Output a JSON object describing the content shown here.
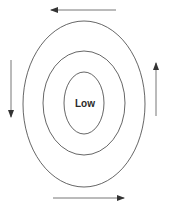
{
  "diagram": {
    "center_label": "Low",
    "line_color": "#555555",
    "arrow_color": "#333333",
    "rings": [
      {
        "name": "outer-ring",
        "cx": 84,
        "cy": 104,
        "rx": 61,
        "ry": 83
      },
      {
        "name": "middle-ring",
        "cx": 84,
        "cy": 103,
        "rx": 41,
        "ry": 52
      },
      {
        "name": "inner-ring",
        "cx": 84,
        "cy": 103,
        "rx": 20,
        "ry": 31
      }
    ],
    "arrows": [
      {
        "name": "top-arrow-left",
        "direction": "left"
      },
      {
        "name": "bottom-arrow-right",
        "direction": "right"
      },
      {
        "name": "left-arrow-down",
        "direction": "down"
      },
      {
        "name": "right-arrow-up",
        "direction": "up"
      }
    ]
  }
}
